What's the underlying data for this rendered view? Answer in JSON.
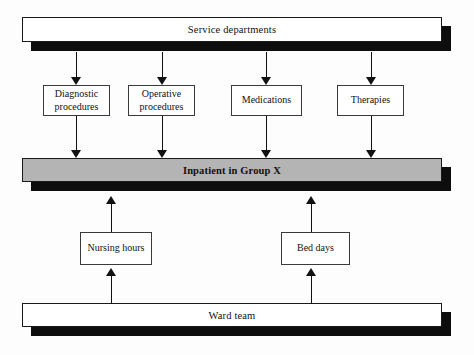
{
  "diagram": {
    "colors": {
      "page_background": "#fdfdfd",
      "bar_fill_white": "#ffffff",
      "bar_fill_gray": "#b4b4b4",
      "shadow": "#0d0d0d",
      "outline": "#1a1a1a",
      "node_outline": "#3a3a3a",
      "text": "#111111"
    },
    "bars": [
      {
        "id": "service-departments",
        "label": "Service departments",
        "fill": "white",
        "bold": false,
        "x": 22,
        "y": 17,
        "width": 420,
        "height": 25,
        "shadow_offset_x": 9,
        "shadow_offset_y": 9
      },
      {
        "id": "inpatient-group-x",
        "label": "Inpatient in Group X",
        "fill": "gray",
        "bold": true,
        "x": 22,
        "y": 158,
        "width": 420,
        "height": 24,
        "shadow_offset_x": 9,
        "shadow_offset_y": 9
      },
      {
        "id": "ward-team",
        "label": "Ward team",
        "fill": "white",
        "bold": false,
        "x": 22,
        "y": 303,
        "width": 420,
        "height": 24,
        "shadow_offset_x": 9,
        "shadow_offset_y": 9
      }
    ],
    "nodes": [
      {
        "id": "diagnostic-procedures",
        "label": "Diagnostic\nprocedures",
        "x": 43,
        "y": 85,
        "width": 67,
        "height": 31
      },
      {
        "id": "operative-procedures",
        "label": "Operative\nprocedures",
        "x": 128,
        "y": 85,
        "width": 67,
        "height": 31
      },
      {
        "id": "medications",
        "label": "Medications",
        "x": 231,
        "y": 85,
        "width": 71,
        "height": 31
      },
      {
        "id": "therapies",
        "label": "Therapies",
        "x": 337,
        "y": 85,
        "width": 67,
        "height": 31
      },
      {
        "id": "nursing-hours",
        "label": "Nursing hours",
        "x": 80,
        "y": 232,
        "width": 72,
        "height": 33
      },
      {
        "id": "bed-days",
        "label": "Bed days",
        "x": 281,
        "y": 232,
        "width": 69,
        "height": 33
      }
    ],
    "arrows": [
      {
        "id": "arrow-service-to-diagnostic",
        "direction": "down",
        "x": 76,
        "y": 52,
        "length": 33,
        "from": "service-departments",
        "to": "diagnostic-procedures"
      },
      {
        "id": "arrow-service-to-operative",
        "direction": "down",
        "x": 162,
        "y": 52,
        "length": 33,
        "from": "service-departments",
        "to": "operative-procedures"
      },
      {
        "id": "arrow-service-to-medications",
        "direction": "down",
        "x": 266,
        "y": 52,
        "length": 33,
        "from": "service-departments",
        "to": "medications"
      },
      {
        "id": "arrow-service-to-therapies",
        "direction": "down",
        "x": 371,
        "y": 52,
        "length": 33,
        "from": "service-departments",
        "to": "therapies"
      },
      {
        "id": "arrow-diagnostic-to-inpatient",
        "direction": "down",
        "x": 76,
        "y": 116,
        "length": 42,
        "from": "diagnostic-procedures",
        "to": "inpatient-group-x"
      },
      {
        "id": "arrow-operative-to-inpatient",
        "direction": "down",
        "x": 162,
        "y": 116,
        "length": 42,
        "from": "operative-procedures",
        "to": "inpatient-group-x"
      },
      {
        "id": "arrow-medications-to-inpatient",
        "direction": "down",
        "x": 266,
        "y": 116,
        "length": 42,
        "from": "medications",
        "to": "inpatient-group-x"
      },
      {
        "id": "arrow-therapies-to-inpatient",
        "direction": "down",
        "x": 371,
        "y": 116,
        "length": 42,
        "from": "therapies",
        "to": "inpatient-group-x"
      },
      {
        "id": "arrow-nursing-to-inpatient",
        "direction": "up",
        "x": 111,
        "y": 196,
        "length": 36,
        "from": "nursing-hours",
        "to": "inpatient-group-x"
      },
      {
        "id": "arrow-beddays-to-inpatient",
        "direction": "up",
        "x": 311,
        "y": 196,
        "length": 36,
        "from": "bed-days",
        "to": "inpatient-group-x"
      },
      {
        "id": "arrow-ward-to-nursing",
        "direction": "up",
        "x": 111,
        "y": 268,
        "length": 36,
        "from": "ward-team",
        "to": "nursing-hours"
      },
      {
        "id": "arrow-ward-to-beddays",
        "direction": "up",
        "x": 311,
        "y": 268,
        "length": 36,
        "from": "ward-team",
        "to": "bed-days"
      }
    ]
  }
}
